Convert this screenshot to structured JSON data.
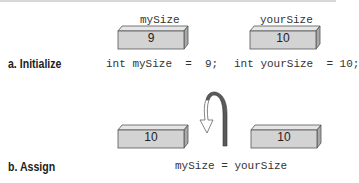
{
  "panel_a": {
    "label": "a. Initialize",
    "variables": [
      {
        "name": "mySize",
        "value": "9",
        "code": "int mySize  =  9;"
      },
      {
        "name": "yourSize",
        "value": "10",
        "code": "int yourSize  = 10;"
      }
    ]
  },
  "panel_b": {
    "label": "b. Assign",
    "boxes": [
      {
        "value": "10"
      },
      {
        "value": "10"
      }
    ],
    "code": "mySize = yourSize",
    "arrow": "curved-arrow-icon"
  },
  "colors": {
    "box_front": "#d3d3d3",
    "box_top": "#e6e6e6",
    "box_side": "#a8a8a8",
    "arrow_dark": "#555555"
  }
}
